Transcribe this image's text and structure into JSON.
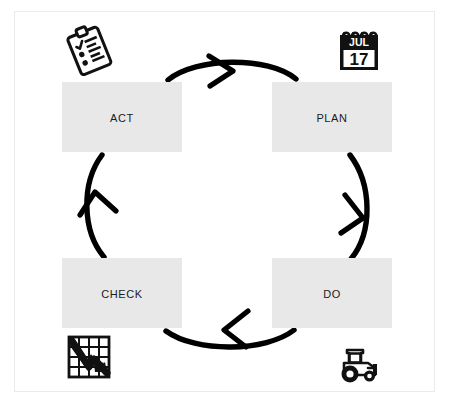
{
  "diagram": {
    "type": "cycle",
    "background_color": "#ffffff",
    "frame_color": "#ebebeb",
    "node_fill_color": "#e8e8e8",
    "arrow_color": "#000000",
    "nodes": [
      {
        "id": "act",
        "label": "Act",
        "position": "top-left",
        "icon": "clipboard-checklist-icon",
        "icon_position": "above"
      },
      {
        "id": "plan",
        "label": "Plan",
        "position": "top-right",
        "icon": "calendar-icon",
        "icon_position": "above",
        "icon_text": {
          "month": "JUL",
          "day": "17"
        }
      },
      {
        "id": "check",
        "label": "Check",
        "position": "bottom-left",
        "icon": "declining-chart-icon",
        "icon_position": "below"
      },
      {
        "id": "do",
        "label": "Do",
        "position": "bottom-right",
        "icon": "tractor-icon",
        "icon_position": "below"
      }
    ],
    "arrows": [
      {
        "id": "act-to-plan",
        "from": "act",
        "to": "plan",
        "direction": "right",
        "edge": "top"
      },
      {
        "id": "plan-to-do",
        "from": "plan",
        "to": "do",
        "direction": "down",
        "edge": "right"
      },
      {
        "id": "do-to-check",
        "from": "do",
        "to": "check",
        "direction": "left",
        "edge": "bottom"
      },
      {
        "id": "check-to-act",
        "from": "check",
        "to": "act",
        "direction": "up",
        "edge": "left"
      }
    ]
  }
}
